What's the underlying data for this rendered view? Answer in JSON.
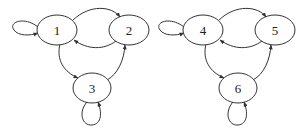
{
  "diagram": {
    "type": "directed-graph",
    "graphs": [
      {
        "name": "left-graph",
        "nodes": [
          {
            "id": "1",
            "label": "1"
          },
          {
            "id": "2",
            "label": "2"
          },
          {
            "id": "3",
            "label": "3"
          }
        ],
        "edges": [
          {
            "from": "1",
            "to": "1",
            "kind": "self-loop"
          },
          {
            "from": "1",
            "to": "2"
          },
          {
            "from": "2",
            "to": "1"
          },
          {
            "from": "1",
            "to": "3"
          },
          {
            "from": "3",
            "to": "2"
          },
          {
            "from": "3",
            "to": "3",
            "kind": "self-loop"
          }
        ]
      },
      {
        "name": "right-graph",
        "nodes": [
          {
            "id": "4",
            "label": "4"
          },
          {
            "id": "5",
            "label": "5"
          },
          {
            "id": "6",
            "label": "6"
          }
        ],
        "edges": [
          {
            "from": "4",
            "to": "4",
            "kind": "self-loop"
          },
          {
            "from": "4",
            "to": "5"
          },
          {
            "from": "5",
            "to": "4"
          },
          {
            "from": "4",
            "to": "6"
          },
          {
            "from": "6",
            "to": "5"
          },
          {
            "from": "6",
            "to": "6",
            "kind": "self-loop"
          }
        ]
      }
    ]
  }
}
